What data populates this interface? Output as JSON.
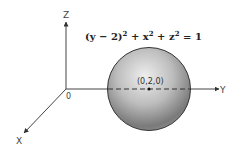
{
  "diagram": {
    "type": "3d-coordinate-sphere",
    "equation": "(y − 2)² + x² + z² = 1",
    "equation_parts": {
      "base1": "(y − 2)",
      "sup1": "2",
      "plus1": " + x",
      "sup2": "2",
      "plus2": " + z",
      "sup3": "2",
      "rhs": " = 1"
    },
    "axes": {
      "x_label": "X",
      "y_label": "Y",
      "z_label": "Z",
      "origin_label": "0"
    },
    "center_label": "(0,2,0)",
    "colors": {
      "axis": "#444444",
      "sphere_light": "#e8e8e8",
      "sphere_mid": "#b5b5b5",
      "sphere_dark": "#6e6e6e",
      "outline": "#333333"
    }
  }
}
